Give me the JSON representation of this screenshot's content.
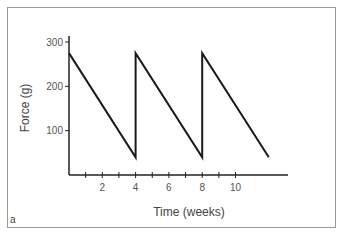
{
  "chart_data": {
    "type": "line",
    "title": "",
    "xlabel": "Time (weeks)",
    "ylabel": "Force (g)",
    "x_ticks": [
      2,
      4,
      6,
      8,
      10
    ],
    "y_ticks": [
      100,
      200,
      300
    ],
    "xlim": [
      0,
      13
    ],
    "ylim": [
      0,
      340
    ],
    "grid": false,
    "legend": null,
    "series": [
      {
        "name": "Force",
        "x": [
          0,
          4,
          4,
          8,
          8,
          12
        ],
        "y": [
          275,
          40,
          275,
          40,
          275,
          40
        ]
      }
    ],
    "panel_label": "a"
  }
}
